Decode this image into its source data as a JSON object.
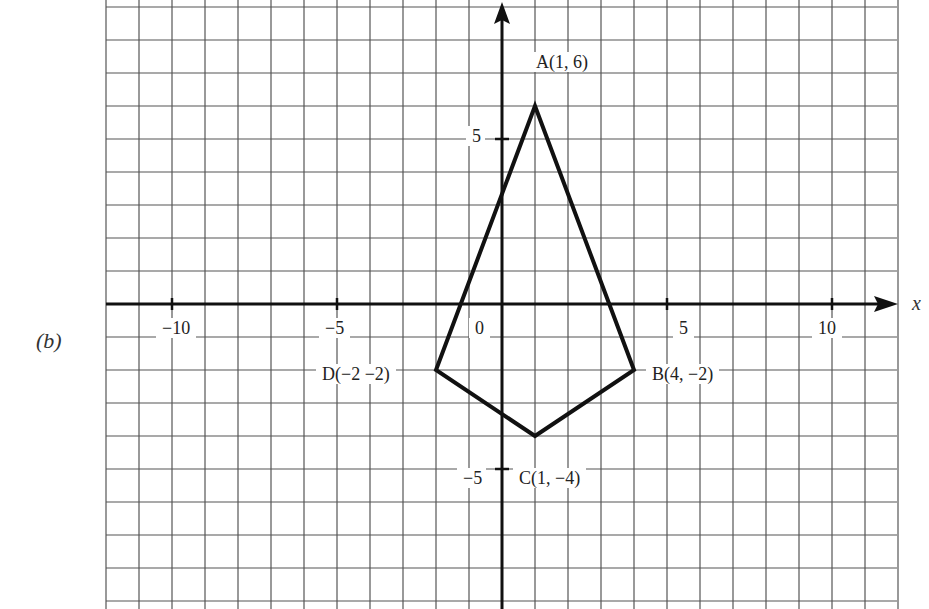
{
  "part_label": "(b)",
  "axes": {
    "x_label": "x",
    "x_ticks": [
      {
        "value": -10,
        "label": "−10"
      },
      {
        "value": -5,
        "label": "−5"
      },
      {
        "value": 0,
        "label": "0"
      },
      {
        "value": 5,
        "label": "5"
      },
      {
        "value": 10,
        "label": "10"
      }
    ],
    "y_ticks": [
      {
        "value": 5,
        "label": "5"
      },
      {
        "value": -5,
        "label": "−5"
      }
    ]
  },
  "points": [
    {
      "name": "A",
      "x": 1,
      "y": 6,
      "label": "A(1, 6)"
    },
    {
      "name": "B",
      "x": 4,
      "y": -2,
      "label": "B(4, −2)"
    },
    {
      "name": "C",
      "x": 1,
      "y": -4,
      "label": "C(1, −4)"
    },
    {
      "name": "D",
      "x": -2,
      "y": -2,
      "label": "D(−2 −2)"
    }
  ],
  "chart_data": {
    "type": "scatter",
    "title": "",
    "xlabel": "x",
    "ylabel": "",
    "xlim": [
      -12,
      12
    ],
    "ylim": [
      -9,
      9
    ],
    "grid": true,
    "polygon": {
      "vertices": [
        [
          1,
          6
        ],
        [
          4,
          -2
        ],
        [
          1,
          -4
        ],
        [
          -2,
          -2
        ]
      ],
      "closed": true
    },
    "series": [
      {
        "name": "quadrilateral ABCD",
        "x": [
          1,
          4,
          1,
          -2
        ],
        "y": [
          6,
          -2,
          -4,
          -2
        ],
        "labels": [
          "A(1, 6)",
          "B(4, −2)",
          "C(1, −4)",
          "D(−2 −2)"
        ]
      }
    ]
  }
}
